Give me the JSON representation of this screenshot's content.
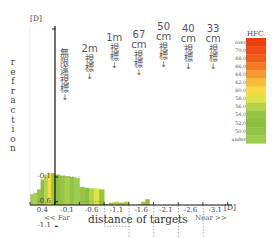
{
  "chart_data": {
    "type": "area",
    "title": "",
    "xlabel": "distance of targets",
    "ylabel": "refraction",
    "y_unit": "[D]",
    "x_unit": "[D]",
    "x_direction_left": "<< Far",
    "x_direction_right": "Near >>",
    "x_ticks": [
      "0.4",
      "-0.1",
      "-0.6",
      "-1.1",
      "-1.6",
      "-2.1",
      "-2.6",
      "-3.1"
    ],
    "y_ticks": [
      "-3.1",
      "-2.6",
      "-2.1",
      "-1.6",
      "-1.1",
      "-0.6",
      "-0.1"
    ],
    "ylim": [
      0.45,
      -3.1
    ],
    "targets": [
      {
        "top": "",
        "vertical": "無限遠視標",
        "demand": -0.1
      },
      {
        "top": "2m",
        "vertical": "視標",
        "demand": -0.6
      },
      {
        "top": "1m",
        "vertical": "視標",
        "demand": -1.1
      },
      {
        "top": "67 cm",
        "vertical": "視標",
        "demand": -1.6
      },
      {
        "top": "50 cm",
        "vertical": "視標",
        "demand": -2.1
      },
      {
        "top": "40 cm",
        "vertical": "視標",
        "demand": -2.6
      },
      {
        "top": "33 cm",
        "vertical": "視標",
        "demand": -3.1
      }
    ],
    "series": [
      {
        "name": "accommodative response (by target segment)",
        "segments": [
          {
            "target": "0.4 (pre)",
            "values": [
              -0.45,
              -0.42,
              -0.35,
              -0.15,
              -0.05,
              -0.02,
              -0.02
            ]
          },
          {
            "target": "-0.1",
            "values": [
              -0.05,
              -0.07,
              -0.08,
              -0.1,
              -0.12
            ]
          },
          {
            "target": "-0.6",
            "values": [
              -0.3,
              -0.32,
              -0.33,
              -0.33,
              -0.35
            ]
          },
          {
            "target": "-1.1",
            "values": [
              -0.65,
              -0.62,
              -0.6,
              -0.62,
              -0.6
            ]
          },
          {
            "target": "-1.6",
            "values": [
              -0.7,
              -0.72,
              -0.65,
              -0.6,
              -0.55,
              -0.7
            ]
          },
          {
            "target": "-2.1",
            "values": [
              -1.4,
              -1.3,
              -1.25,
              -1.1,
              -1.05,
              -1.0
            ]
          },
          {
            "target": "-2.6",
            "values": [
              -2.25,
              -2.28,
              -2.2,
              -2.25,
              -2.3,
              -2.22
            ]
          },
          {
            "target": "-3.1",
            "values": [
              -2.55,
              -2.35,
              -2.45,
              -2.3,
              -2.4,
              -2.1
            ]
          },
          {
            "target": "tail",
            "values": [
              -1.95
            ]
          }
        ]
      }
    ],
    "hfc_legend": {
      "title": "HFC",
      "labels": [
        "over",
        "70.0",
        "68.0",
        "66.0",
        "64.0",
        "62.0",
        "60.0",
        "58.0",
        "56.0",
        "54.0",
        "52.0",
        "50.0",
        "under"
      ],
      "colors": [
        "#ee3e10",
        "#f04c14",
        "#f25e18",
        "#f47a22",
        "#f69a2c",
        "#f8bc38",
        "#f6dc40",
        "#dfe446",
        "#b4d24a",
        "#98c446",
        "#8cbe42",
        "#92c448",
        "#9ecc4e"
      ]
    },
    "stripe_colors": {
      "0.4 (pre)": [
        "#9ccc4c",
        "#a8d04e",
        "#92c448",
        "#8cbe42",
        "#b4d24a",
        "#f6dc40",
        "#98c446"
      ],
      "-0.1": [
        "#8cbe42",
        "#98c446",
        "#a8d04e",
        "#92c448",
        "#9ecc4e"
      ],
      "-0.6": [
        "#98c446",
        "#8cbe42",
        "#b4d24a",
        "#dfe446",
        "#92c448"
      ],
      "-1.1": [
        "#8cbe42",
        "#98c446",
        "#b4d24a",
        "#92c448",
        "#a8d04e"
      ],
      "-1.6": [
        "#98c446",
        "#b4d24a",
        "#dfe446",
        "#92c448",
        "#8cbe42",
        "#b4d24a"
      ],
      "-2.1": [
        "#8cbe42",
        "#98c446",
        "#dfe446",
        "#f6dc40",
        "#f8bc38",
        "#f6dc40"
      ],
      "-2.6": [
        "#f6dc40",
        "#b4d24a",
        "#f6dc40",
        "#dfe446",
        "#f8bc38",
        "#f6dc40"
      ],
      "-3.1": [
        "#f8bc38",
        "#f69a2c",
        "#f47a22",
        "#f69a2c",
        "#f25e18",
        "#f47a22"
      ],
      "tail": [
        "#9ecc4e"
      ]
    }
  }
}
